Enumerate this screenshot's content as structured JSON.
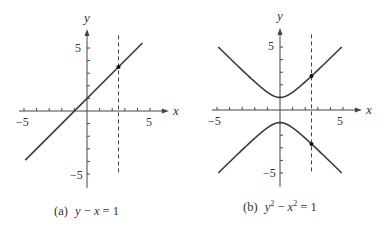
{
  "chart_data": [
    {
      "type": "line",
      "id": "a",
      "caption": "(a)  y − x = 1",
      "caption_parts": {
        "label": "(a)",
        "equation": "y − x = 1"
      },
      "equation": "y - x = 1",
      "xlabel": "x",
      "ylabel": "y",
      "xlim": [
        -5,
        5
      ],
      "ylim": [
        -5,
        5
      ],
      "x_tick_labels": [
        "-5",
        "5"
      ],
      "y_tick_labels": [
        "5",
        "-5"
      ],
      "ticks_every": 1,
      "series": [
        {
          "name": "y = x + 1",
          "x": [
            -4.9,
            4.4
          ],
          "y": [
            -3.9,
            5.4
          ]
        }
      ],
      "vertical_dashed_line": {
        "x": 2.5
      },
      "points": [
        {
          "x": 2.5,
          "y": 3.5
        }
      ],
      "grid": false
    },
    {
      "type": "line",
      "id": "b",
      "caption": "(b)  y² − x² = 1",
      "caption_parts": {
        "label": "(b)",
        "equation": "y² − x² = 1"
      },
      "equation": "y^2 - x^2 = 1",
      "xlabel": "x",
      "ylabel": "y",
      "xlim": [
        -5,
        5
      ],
      "ylim": [
        -5,
        5
      ],
      "x_tick_labels": [
        "-5",
        "5"
      ],
      "y_tick_labels": [
        "5",
        "-5"
      ],
      "ticks_every": 1,
      "series": [
        {
          "name": "upper branch y = sqrt(1 + x^2)",
          "x_range": [
            -4.9,
            4.9
          ]
        },
        {
          "name": "lower branch y = -sqrt(1 + x^2)",
          "x_range": [
            -4.9,
            4.9
          ]
        }
      ],
      "vertical_dashed_line": {
        "x": 2.5
      },
      "points": [
        {
          "x": 2.5,
          "y": 2.69
        },
        {
          "x": 2.5,
          "y": -2.69
        }
      ],
      "grid": false
    }
  ],
  "labels": {
    "a": {
      "caption_label": "(a)",
      "caption_eq_y": "y",
      "caption_eq_rest": " − ",
      "caption_eq_x": "x",
      "caption_eq_end": " = 1",
      "x": "x",
      "y": "y",
      "xneg": "−5",
      "xpos": "5",
      "ypos": "5",
      "yneg": "−5"
    },
    "b": {
      "caption_label": "(b)",
      "x": "x",
      "y": "y",
      "xneg": "−5",
      "xpos": "5",
      "ypos": "5",
      "yneg": "−5"
    }
  },
  "colors": {
    "curve": "#3a3a3a",
    "axis": "#444444",
    "text": "#333333"
  }
}
